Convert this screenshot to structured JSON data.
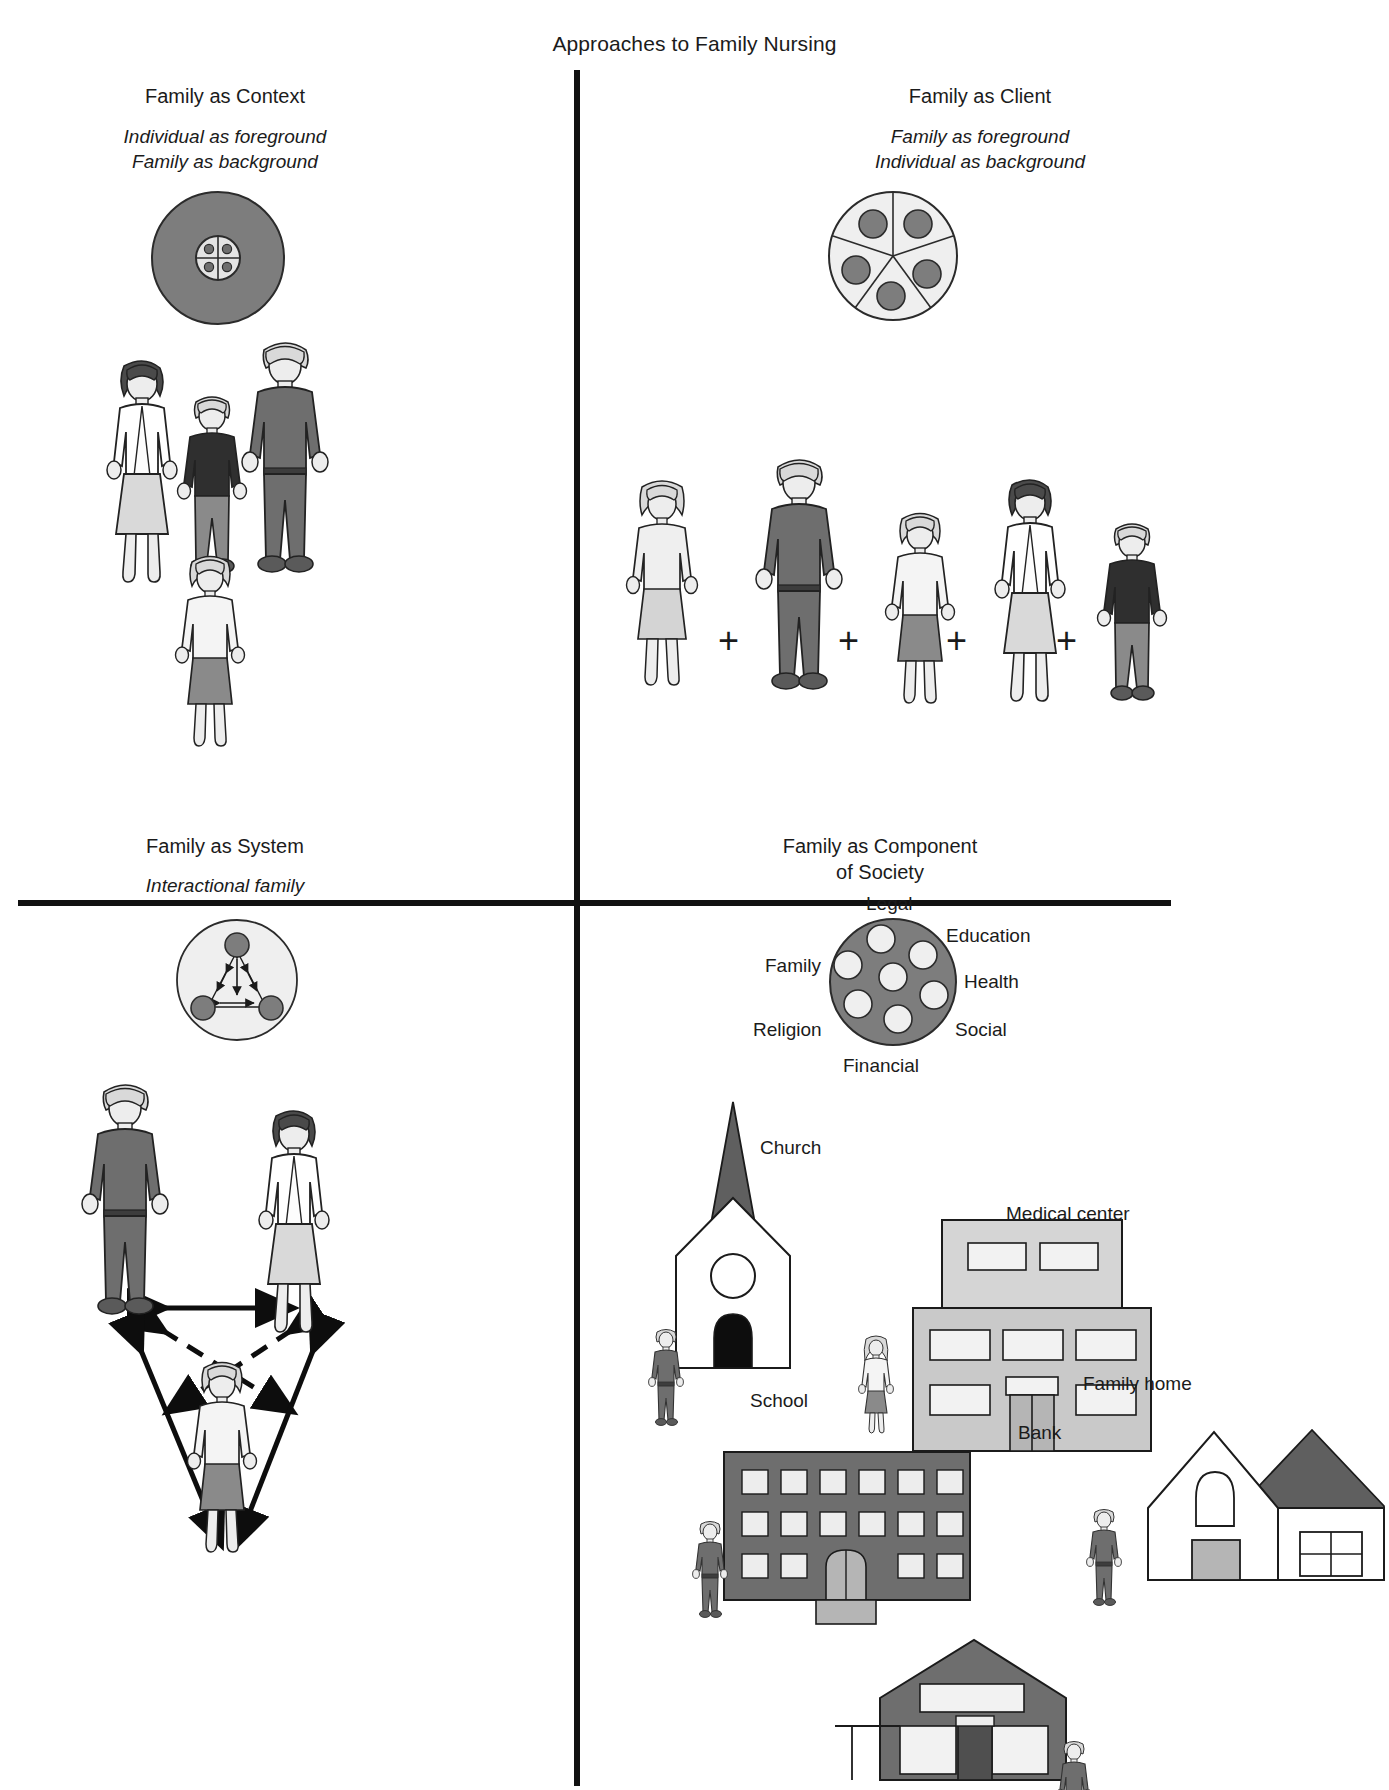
{
  "figure": {
    "title": "Approaches to Family Nursing"
  },
  "quadrants": [
    {
      "id": "family-as-context",
      "title": "Family as Context",
      "subtitle_lines": [
        "Individual as foreground",
        "Family as background"
      ],
      "diagram": {
        "type": "filled-circle-with-quartered-core",
        "outer_fill": "#7d7d7d",
        "core_fill": "#e2e2e2",
        "core_dots": 4
      },
      "figures": [
        {
          "role": "mother",
          "shirt": "#ffffff",
          "skirt": "#d9d9d9",
          "hair": "#4a4a4a"
        },
        {
          "role": "child-boy",
          "shirt": "#2f2f2f",
          "pants": "#8a8a8a",
          "hair": "#d9d9d9"
        },
        {
          "role": "father",
          "shirt": "#6e6e6e",
          "pants": "#6e6e6e",
          "hair": "#d9d9d9"
        },
        {
          "role": "child-girl",
          "shirt": "#f2f2f2",
          "skirt": "#8a8a8a",
          "hair": "#d9d9d9"
        }
      ]
    },
    {
      "id": "family-as-client",
      "title": "Family as Client",
      "subtitle_lines": [
        "Family as foreground",
        "Individual as background"
      ],
      "diagram": {
        "type": "segmented-circle-with-member-dots",
        "outer_fill": "#efefef",
        "segments": 5,
        "dot_fill": "#7d7d7d",
        "dots": 5
      },
      "figures": [
        {
          "role": "girl",
          "shirt": "#efefef",
          "skirt": "#d4d4d4",
          "hair": "#d9d9d9"
        },
        {
          "role": "father",
          "shirt": "#6e6e6e",
          "pants": "#6e6e6e",
          "hair": "#d9d9d9"
        },
        {
          "role": "child-girl",
          "shirt": "#f2f2f2",
          "skirt": "#8a8a8a",
          "hair": "#d9d9d9"
        },
        {
          "role": "mother",
          "shirt": "#ffffff",
          "skirt": "#d9d9d9",
          "hair": "#4a4a4a"
        },
        {
          "role": "child-boy",
          "shirt": "#2f2f2f",
          "pants": "#8a8a8a",
          "hair": "#d9d9d9"
        }
      ],
      "operators": [
        "+",
        "+",
        "+",
        "+"
      ]
    },
    {
      "id": "family-as-system",
      "title": "Family as System",
      "subtitle_lines": [
        "Interactional family"
      ],
      "diagram": {
        "type": "circle-with-three-nodes-and-arrows",
        "outer_fill": "#efefef",
        "node_fill": "#7d7d7d",
        "nodes": 3
      },
      "figures": [
        {
          "role": "father",
          "shirt": "#6e6e6e",
          "pants": "#6e6e6e",
          "hair": "#d9d9d9"
        },
        {
          "role": "mother",
          "shirt": "#ffffff",
          "skirt": "#d9d9d9",
          "hair": "#4a4a4a"
        },
        {
          "role": "child-girl",
          "shirt": "#f2f2f2",
          "skirt": "#8a8a8a",
          "hair": "#d9d9d9"
        }
      ]
    },
    {
      "id": "family-as-component-of-society",
      "title_lines": [
        "Family as Component",
        "of Society"
      ],
      "title": "Family as Component of Society",
      "diagram": {
        "type": "society-circle",
        "outer_fill": "#7d7d7d",
        "dot_fill": "#efefef",
        "dots": 7,
        "labels": [
          {
            "text": "Legal",
            "position": "top"
          },
          {
            "text": "Education",
            "position": "top-right"
          },
          {
            "text": "Health",
            "position": "right"
          },
          {
            "text": "Social",
            "position": "bottom-right"
          },
          {
            "text": "Financial",
            "position": "bottom"
          },
          {
            "text": "Religion",
            "position": "bottom-left"
          },
          {
            "text": "Family",
            "position": "left"
          }
        ]
      },
      "buildings": [
        {
          "name": "church",
          "label": "Church"
        },
        {
          "name": "medical-center",
          "label": "Medical center"
        },
        {
          "name": "school",
          "label": "School"
        },
        {
          "name": "family-home",
          "label": "Family home"
        },
        {
          "name": "bank",
          "label": "Bank"
        }
      ]
    }
  ],
  "colors": {
    "ink": "#1b1b1b",
    "mid_gray": "#7d7d7d",
    "dark_gray": "#5f5f5f",
    "light_gray": "#d9d9d9",
    "pale_gray": "#efefef",
    "near_black": "#2f2f2f"
  }
}
